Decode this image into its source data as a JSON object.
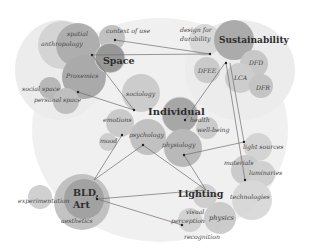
{
  "diagram": {
    "title": "",
    "colors": {
      "background_blob": "#efefef",
      "circle_dark": "#9a9a9a",
      "circle_mid": "#b5b5b5",
      "circle_light": "#cfcfcf",
      "edge": "#6e6e6e",
      "node_dot": "#222222"
    },
    "hubs": [
      {
        "id": "space",
        "label": "Space",
        "x": 130,
        "y": 61
      },
      {
        "id": "sustainability",
        "label": "Sustainability",
        "x": 258,
        "y": 40
      },
      {
        "id": "individual",
        "label": "Individual",
        "x": 176,
        "y": 112
      },
      {
        "id": "bld_art_line1",
        "label": "BLD,",
        "x": 82,
        "y": 193
      },
      {
        "id": "bld_art_line2",
        "label": "Art",
        "x": 82,
        "y": 205
      },
      {
        "id": "lighting",
        "label": "Lighting",
        "x": 186,
        "y": 194
      }
    ],
    "topics": [
      {
        "id": "spatial",
        "label": "spatial",
        "x": 77,
        "y": 35
      },
      {
        "id": "anthropology",
        "label": "anthropology",
        "x": 66,
        "y": 45
      },
      {
        "id": "context_of_use",
        "label": "context of use",
        "x": 127,
        "y": 33
      },
      {
        "id": "proxemics",
        "label": "Proxemics",
        "x": 83,
        "y": 77
      },
      {
        "id": "social_space",
        "label": "social space",
        "x": 40,
        "y": 90
      },
      {
        "id": "personal_space",
        "label": "personal space",
        "x": 55,
        "y": 101
      },
      {
        "id": "design_for",
        "label": "design for",
        "x": 198,
        "y": 31
      },
      {
        "id": "durability",
        "label": "durability",
        "x": 198,
        "y": 40
      },
      {
        "id": "dfee",
        "label": "DFEE",
        "x": 205,
        "y": 71
      },
      {
        "id": "dfd",
        "label": "DFD",
        "x": 254,
        "y": 63
      },
      {
        "id": "lca",
        "label": "LCA",
        "x": 239,
        "y": 78
      },
      {
        "id": "dfr",
        "label": "DFR",
        "x": 261,
        "y": 88
      },
      {
        "id": "sociology",
        "label": "sociology",
        "x": 139,
        "y": 94
      },
      {
        "id": "emotions",
        "label": "emotions",
        "x": 116,
        "y": 120
      },
      {
        "id": "health",
        "label": "health",
        "x": 199,
        "y": 120
      },
      {
        "id": "well_being",
        "label": "well-being",
        "x": 209,
        "y": 130
      },
      {
        "id": "psychology",
        "label": "psychology",
        "x": 147,
        "y": 135
      },
      {
        "id": "mood",
        "label": "mood",
        "x": 106,
        "y": 141
      },
      {
        "id": "physiology",
        "label": "physiology",
        "x": 178,
        "y": 145
      },
      {
        "id": "light_sources",
        "label": "light sources",
        "x": 260,
        "y": 147
      },
      {
        "id": "materials",
        "label": "materials",
        "x": 241,
        "y": 164
      },
      {
        "id": "luminaries",
        "label": "luminaries",
        "x": 264,
        "y": 173
      },
      {
        "id": "technologies",
        "label": "technologies",
        "x": 255,
        "y": 197
      },
      {
        "id": "experimentation",
        "label": "experimentation",
        "x": 40,
        "y": 201
      },
      {
        "id": "aesthetics",
        "label": "aesthetics",
        "x": 80,
        "y": 221
      },
      {
        "id": "visual",
        "label": "visual",
        "x": 192,
        "y": 212
      },
      {
        "id": "perception",
        "label": "perception",
        "x": 188,
        "y": 221
      },
      {
        "id": "physics",
        "label": "physics",
        "x": 223,
        "y": 218
      },
      {
        "id": "recognition",
        "label": "recognition",
        "x": 202,
        "y": 237
      }
    ]
  }
}
